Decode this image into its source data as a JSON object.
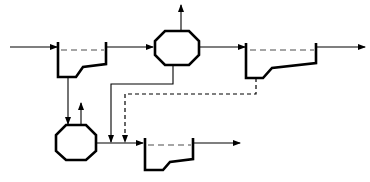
{
  "diagram": {
    "type": "process-flow",
    "colors": {
      "line": "#000000",
      "water_surface": "#888888",
      "background": "#ffffff"
    },
    "nodes": [
      {
        "id": "tank-1",
        "kind": "settling-tank"
      },
      {
        "id": "reactor-1",
        "kind": "octagon-vessel"
      },
      {
        "id": "tank-2",
        "kind": "settling-tank"
      },
      {
        "id": "reactor-2",
        "kind": "octagon-vessel"
      },
      {
        "id": "tank-3",
        "kind": "settling-tank"
      }
    ],
    "edges": [
      {
        "from": "inlet",
        "to": "tank-1",
        "style": "solid"
      },
      {
        "from": "tank-1",
        "to": "reactor-1",
        "style": "solid"
      },
      {
        "from": "reactor-1",
        "to": "vent-1",
        "style": "solid",
        "direction": "up"
      },
      {
        "from": "reactor-1",
        "to": "tank-2",
        "style": "solid"
      },
      {
        "from": "tank-2",
        "to": "outlet-1",
        "style": "solid"
      },
      {
        "from": "tank-1",
        "to": "reactor-2",
        "style": "solid"
      },
      {
        "from": "reactor-2",
        "to": "vent-2",
        "style": "solid",
        "direction": "up"
      },
      {
        "from": "reactor-1",
        "to": "tank-3-feed",
        "style": "solid"
      },
      {
        "from": "tank-2",
        "to": "tank-3-feed",
        "style": "dashed"
      },
      {
        "from": "reactor-2",
        "to": "tank-3",
        "style": "solid"
      },
      {
        "from": "tank-3",
        "to": "outlet-2",
        "style": "solid"
      }
    ]
  }
}
